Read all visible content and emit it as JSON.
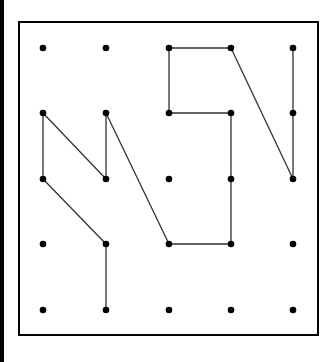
{
  "diagram": {
    "type": "dot-grid-polyline",
    "grid": {
      "columns": 5,
      "rows": 5,
      "col_x": [
        43,
        106,
        169,
        231,
        293
      ],
      "row_y": [
        48,
        113,
        179,
        244,
        310
      ]
    },
    "frame": {
      "x": 19,
      "y": 22,
      "width": 299,
      "height": 313
    },
    "colors": {
      "dot": "#000000",
      "line": "#333333",
      "frame": "#000000",
      "background": "#ffffff",
      "left_bar": "#000000"
    },
    "path": [
      [
        1,
        4
      ],
      [
        1,
        3
      ],
      [
        0,
        2
      ],
      [
        0,
        1
      ],
      [
        1,
        2
      ],
      [
        1,
        1
      ],
      [
        2,
        3
      ],
      [
        3,
        3
      ],
      [
        3,
        1
      ],
      [
        2,
        1
      ],
      [
        2,
        0
      ],
      [
        3,
        0
      ],
      [
        4,
        2
      ],
      [
        4,
        0
      ]
    ]
  }
}
